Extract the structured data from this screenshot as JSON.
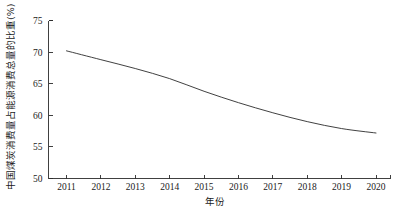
{
  "chart_data": {
    "type": "line",
    "title": "",
    "xlabel": "年份",
    "ylabel": "中国煤炭消费量占能源消费总量的比重(%)",
    "categories": [
      2011,
      2012,
      2013,
      2014,
      2015,
      2016,
      2017,
      2018,
      2019,
      2020
    ],
    "x_tick_labels": [
      "2011",
      "2012",
      "2013",
      "2014",
      "2015",
      "2016",
      "2017",
      "2018",
      "2019",
      "2020"
    ],
    "y_tick_labels": [
      "50",
      "55",
      "60",
      "65",
      "70",
      "75"
    ],
    "y_ticks": [
      50,
      55,
      60,
      65,
      70,
      75
    ],
    "ylim": [
      50,
      75
    ],
    "grid": false,
    "legend": false,
    "series": [
      {
        "name": "中国煤炭消费量占能源消费总量的比重",
        "values": [
          70.2,
          68.8,
          67.4,
          65.8,
          63.8,
          62.0,
          60.4,
          59.0,
          57.9,
          57.2
        ]
      }
    ],
    "line_color": "#2b2b2b"
  }
}
